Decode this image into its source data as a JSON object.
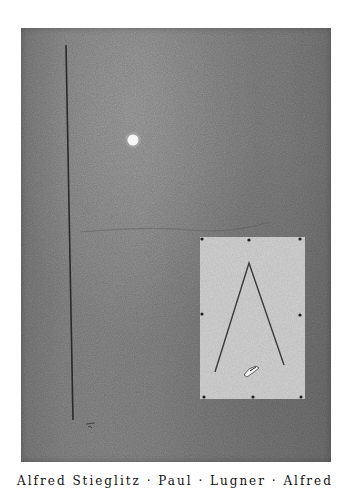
{
  "artwork": {
    "board_color": "#8a8a8a",
    "panel_color": "#d8d8d8",
    "line_color": "#2a2a2a",
    "moon_color": "#f4f4f4",
    "elements": {
      "vertical_line": {
        "x1": 66,
        "y1": 45,
        "x2": 73,
        "y2": 420
      },
      "moon": {
        "cx": 133,
        "cy": 140,
        "r": 5
      },
      "panel": {
        "x": 200,
        "y": 237,
        "width": 105,
        "height": 162
      },
      "pins": [
        {
          "x": 202,
          "y": 239
        },
        {
          "x": 249,
          "y": 240
        },
        {
          "x": 300,
          "y": 239
        },
        {
          "x": 202,
          "y": 314
        },
        {
          "x": 300,
          "y": 315
        },
        {
          "x": 204,
          "y": 397
        },
        {
          "x": 253,
          "y": 397
        },
        {
          "x": 301,
          "y": 397
        }
      ],
      "chevron": {
        "apex": {
          "x": 249,
          "y": 263
        },
        "left": {
          "x": 215,
          "y": 372
        },
        "right": {
          "x": 284,
          "y": 365
        }
      },
      "scrap": {
        "x": 250,
        "y": 371
      },
      "signature": {
        "x": 90,
        "y": 425
      }
    }
  },
  "caption": {
    "text": "Alfred Stieglitz · Paul · Lugner · Alfred"
  }
}
